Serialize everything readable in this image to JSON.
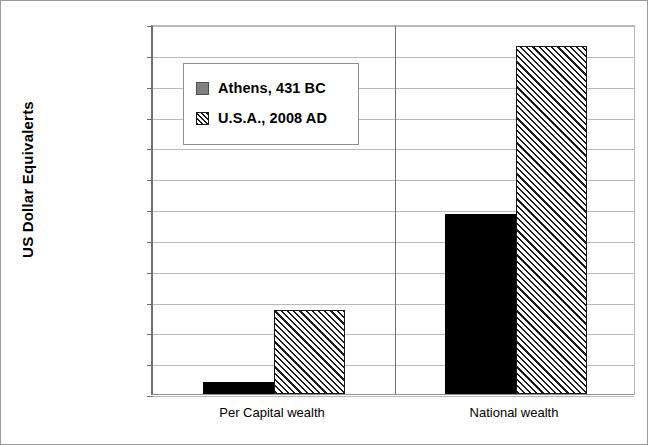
{
  "chart_data": {
    "type": "bar",
    "title": "",
    "xlabel": "",
    "ylabel": "US Dollar Equivalerts",
    "yscale": "log",
    "ylim": [
      1000,
      1000000000000000
    ],
    "grid": true,
    "legend_position": "inside-upper-left",
    "categories": [
      "Per Capital wealth",
      "National wealth"
    ],
    "ytick_labels": [
      "$1,000,000,000,000,000",
      "$100,000,000,000,000",
      "$10,000,000,000,000",
      "$1,000,000,000,000",
      "$100,000,000,000",
      "$10,000,000,000",
      "$1,000,000,000",
      "$100,000,000",
      "$10,000,000",
      "$1,000,000",
      "$100,000",
      "$10,000",
      "$1,000"
    ],
    "ytick_values": [
      1000000000000000,
      100000000000000,
      10000000000000,
      1000000000000,
      100000000000,
      10000000000,
      1000000000,
      100000000,
      10000000,
      1000000,
      100000,
      10000,
      1000
    ],
    "series": [
      {
        "name": "Athens, 431 BC",
        "style": "solid-black",
        "values": [
          2500,
          700000000
        ],
        "value_labels": [
          "$2,500",
          "$700,000,000"
        ]
      },
      {
        "name": "U.S.A., 2008 AD",
        "style": "diagonal-hatch",
        "values": [
          550000,
          200000000000000
        ],
        "value_labels": [
          "$550,000",
          "$200,000,000,000,000"
        ]
      }
    ]
  },
  "legend": {
    "items": [
      {
        "label": "Athens, 431 BC",
        "swatch": "solid-gray-square"
      },
      {
        "label": "U.S.A., 2008 AD",
        "swatch": "hatched-square"
      }
    ]
  },
  "colors": {
    "series_athens": "#000000",
    "series_usa_fill": "#ffffff",
    "series_usa_hatch": "#1a1a1a",
    "legend_athens_swatch": "#808080",
    "gridline": "#b9b9b9",
    "axis": "#6f6f6f",
    "background": "#ffffff"
  }
}
